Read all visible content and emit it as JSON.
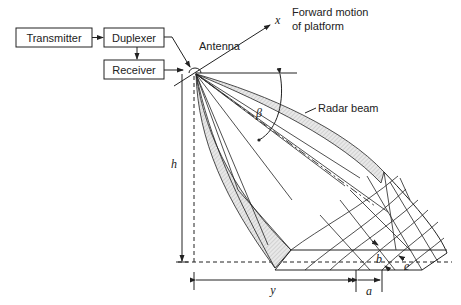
{
  "diagram": {
    "blocks": {
      "transmitter": "Transmitter",
      "duplexer": "Duplexer",
      "receiver": "Receiver"
    },
    "labels": {
      "antenna": "Antenna",
      "x_axis": "x",
      "forward_motion_line1": "Forward motion",
      "forward_motion_line2": "of platform",
      "radar_beam": "Radar beam",
      "beta": "β",
      "h": "h",
      "y": "y",
      "a": "a",
      "b": "b",
      "e": "e"
    }
  }
}
